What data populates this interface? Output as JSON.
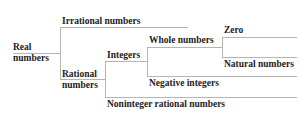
{
  "diagram": {
    "type": "tree",
    "line_color": "#b5b5b5",
    "text_color": "#222222",
    "nodes": {
      "real": {
        "line1": "Real",
        "line2": "numbers"
      },
      "irrational": {
        "label": "Irrational numbers"
      },
      "rational": {
        "line1": "Rational",
        "line2": "numbers"
      },
      "integers": {
        "label": "Integers"
      },
      "whole": {
        "label": "Whole numbers"
      },
      "zero": {
        "label": "Zero"
      },
      "natural": {
        "label": "Natural numbers"
      },
      "negative": {
        "label": "Negative integers"
      },
      "noninteger": {
        "label": "Noninteger rational numbers"
      }
    },
    "edges": [
      [
        "Real numbers",
        "Irrational numbers"
      ],
      [
        "Real numbers",
        "Rational numbers"
      ],
      [
        "Rational numbers",
        "Integers"
      ],
      [
        "Rational numbers",
        "Noninteger rational numbers"
      ],
      [
        "Integers",
        "Whole numbers"
      ],
      [
        "Integers",
        "Negative integers"
      ],
      [
        "Whole numbers",
        "Zero"
      ],
      [
        "Whole numbers",
        "Natural numbers"
      ]
    ]
  }
}
